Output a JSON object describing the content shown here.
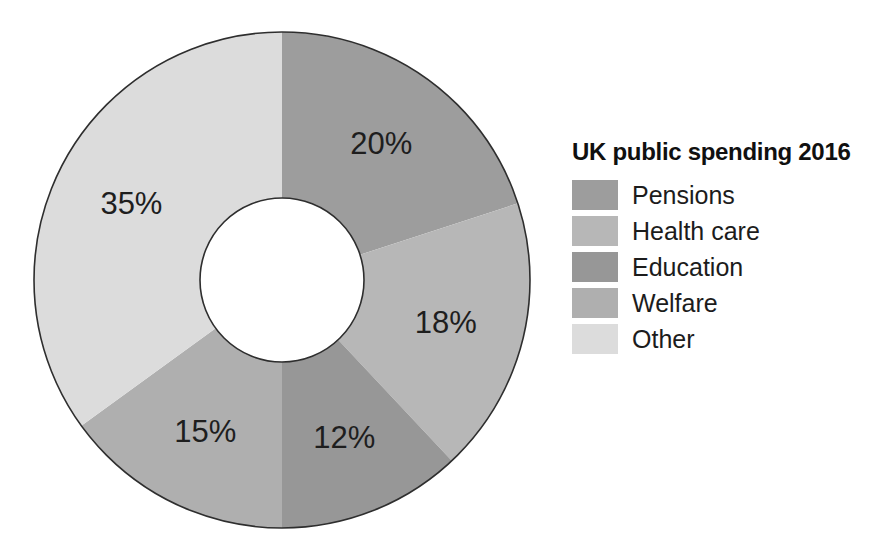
{
  "page": {
    "background": "#ffffff"
  },
  "chart_data": {
    "type": "pie",
    "subtype": "donut",
    "title": "UK public spending 2016",
    "categories": [
      "Pensions",
      "Health care",
      "Education",
      "Welfare",
      "Other"
    ],
    "values": [
      20,
      18,
      12,
      15,
      35
    ],
    "labels": [
      "20%",
      "18%",
      "12%",
      "15%",
      "35%"
    ],
    "colors": [
      "#9d9d9d",
      "#b7b7b7",
      "#979797",
      "#afafaf",
      "#dcdcdc"
    ],
    "unit": "%",
    "total": 100,
    "start_angle_deg": 0,
    "direction": "clockwise",
    "legend_position": "right",
    "outline_color": "#2e2e2e",
    "label_color": "#1e1e1e",
    "hole_fill": "#ffffff"
  }
}
